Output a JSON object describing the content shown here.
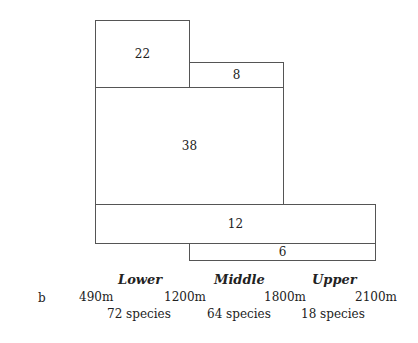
{
  "diagram": {
    "boxes": [
      {
        "id": "box-22",
        "value": "22"
      },
      {
        "id": "box-8",
        "value": "8"
      },
      {
        "id": "box-38",
        "value": "38"
      },
      {
        "id": "box-12",
        "value": "12"
      },
      {
        "id": "box-6",
        "value": "6"
      }
    ],
    "panel_label": "b",
    "zones": [
      {
        "name": "Lower",
        "species": "72 species"
      },
      {
        "name": "Middle",
        "species": "64 species"
      },
      {
        "name": "Upper",
        "species": "18 species"
      }
    ],
    "elevations": [
      "490m",
      "1200m",
      "1800m",
      "2100m"
    ]
  }
}
